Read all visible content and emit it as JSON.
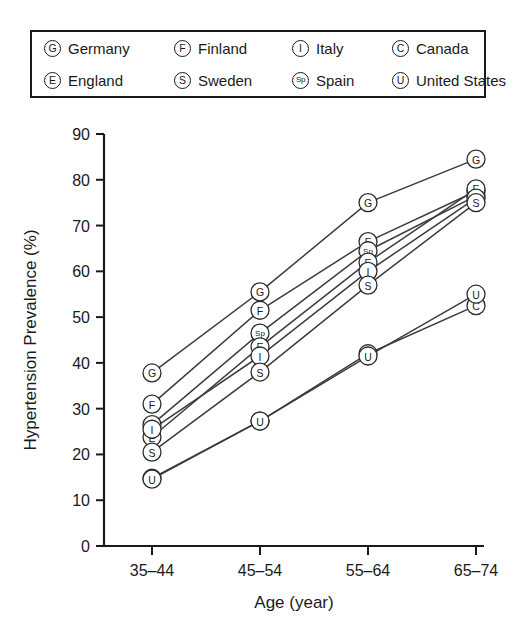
{
  "legend": {
    "entries": [
      {
        "symbol": "G",
        "label": "Germany"
      },
      {
        "symbol": "F",
        "label": "Finland"
      },
      {
        "symbol": "I",
        "label": "Italy"
      },
      {
        "symbol": "C",
        "label": "Canada"
      },
      {
        "symbol": "E",
        "label": "England"
      },
      {
        "symbol": "S",
        "label": "Sweden"
      },
      {
        "symbol": "Sp",
        "label": "Spain"
      },
      {
        "symbol": "U",
        "label": "United States"
      }
    ]
  },
  "chart_data": {
    "type": "line",
    "title": "",
    "xlabel": "Age (year)",
    "ylabel": "Hypertension Prevalence (%)",
    "categories": [
      "35–44",
      "45–54",
      "55–64",
      "65–74"
    ],
    "ylim": [
      0,
      90
    ],
    "yticks": [
      0,
      10,
      20,
      30,
      40,
      50,
      60,
      70,
      80,
      90
    ],
    "grid": false,
    "legend_position": "top",
    "series": [
      {
        "name": "Germany",
        "symbol": "G",
        "values": [
          37.8,
          55.5,
          75.0,
          84.5
        ]
      },
      {
        "name": "Finland",
        "symbol": "F",
        "values": [
          31.0,
          51.5,
          66.5,
          77.5
        ]
      },
      {
        "name": "Spain",
        "symbol": "Sp",
        "values": [
          26.5,
          46.5,
          64.5,
          76.5
        ]
      },
      {
        "name": "England",
        "symbol": "E",
        "values": [
          23.8,
          43.5,
          62.0,
          78.0
        ]
      },
      {
        "name": "Italy",
        "symbol": "I",
        "values": [
          25.5,
          41.5,
          60.0,
          76.0
        ]
      },
      {
        "name": "Sweden",
        "symbol": "S",
        "values": [
          20.5,
          38.0,
          57.0,
          75.0
        ]
      },
      {
        "name": "Canada",
        "symbol": "C",
        "values": [
          14.8,
          27.3,
          42.0,
          52.5
        ]
      },
      {
        "name": "United States",
        "symbol": "U",
        "values": [
          14.6,
          27.3,
          41.5,
          55.0
        ]
      }
    ]
  }
}
